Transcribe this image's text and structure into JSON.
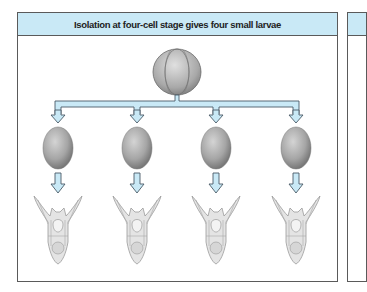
{
  "panel": {
    "title": "Isolation at four-cell stage gives four small larvae"
  },
  "diagram": {
    "source": {
      "label": "four-cell embryo",
      "cx": 177,
      "cy": 72
    },
    "arrow_color": "#c9e9f6",
    "arrow_stroke": "#4a5a66",
    "cells": [
      {
        "label": "isolated blastomere 1",
        "cx": 58
      },
      {
        "label": "isolated blastomere 2",
        "cx": 137
      },
      {
        "label": "isolated blastomere 3",
        "cx": 216
      },
      {
        "label": "isolated blastomere 4",
        "cx": 296
      }
    ],
    "larvae": [
      {
        "label": "small larva 1"
      },
      {
        "label": "small larva 2"
      },
      {
        "label": "small larva 3"
      },
      {
        "label": "small larva 4"
      }
    ]
  }
}
